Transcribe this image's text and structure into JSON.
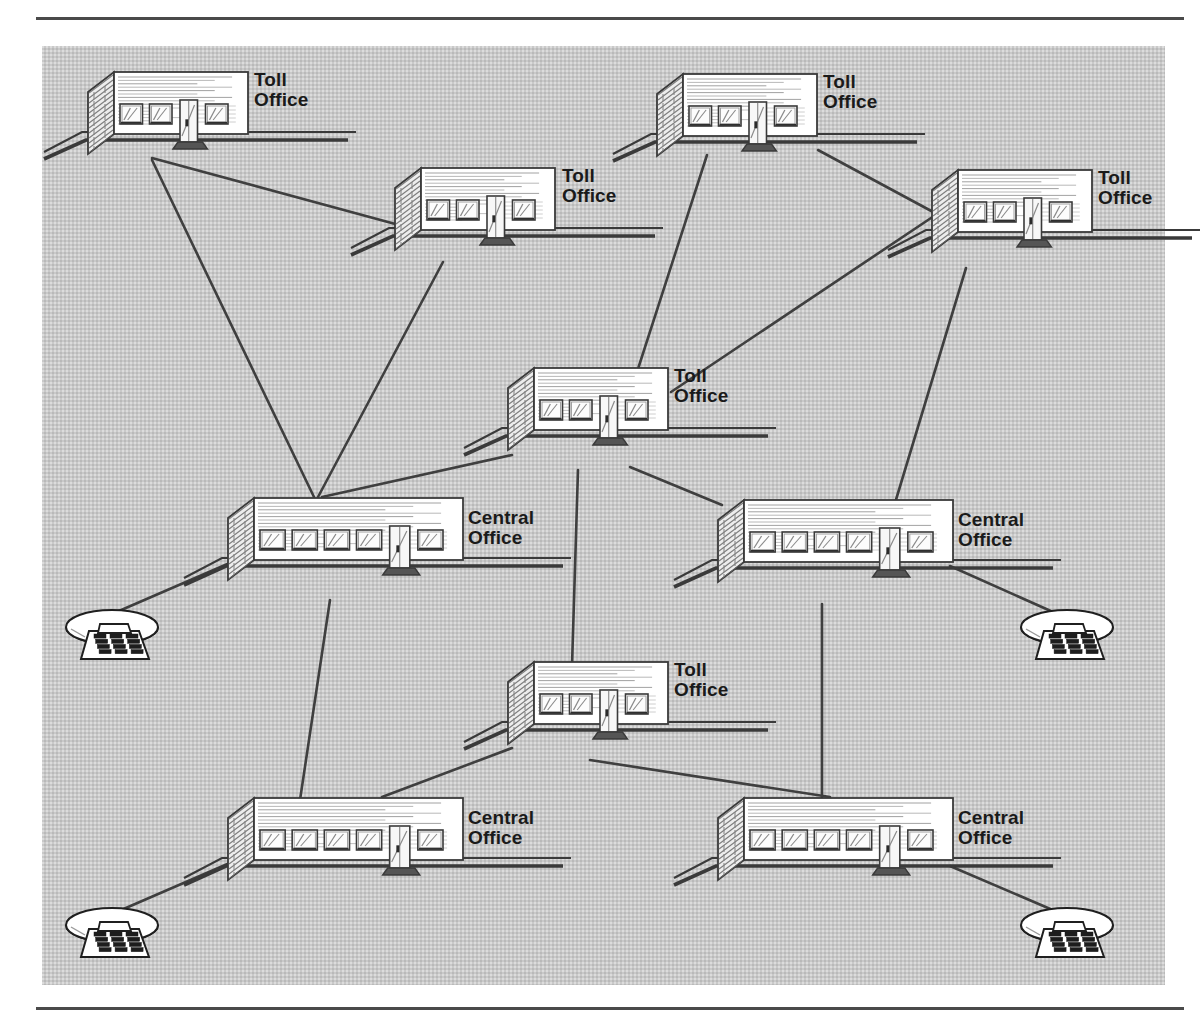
{
  "figure": {
    "type": "telephone-network-hierarchy-diagram",
    "background_color": "#c9c9c9",
    "line_color": "#3a3a3a",
    "building_face_color": "#ffffff",
    "labels": {
      "toll_office": "Toll\nOffice",
      "central_office": "Central\nOffice"
    }
  },
  "nodes": [
    {
      "id": "toll-1",
      "kind": "toll-office",
      "label": "Toll\nOffice",
      "x": 88,
      "y": 72,
      "width": 160,
      "label_x": 254,
      "label_y": 70
    },
    {
      "id": "toll-2",
      "kind": "toll-office",
      "label": "Toll\nOffice",
      "x": 395,
      "y": 168,
      "width": 160,
      "label_x": 562,
      "label_y": 166
    },
    {
      "id": "toll-3",
      "kind": "toll-office",
      "label": "Toll\nOffice",
      "x": 657,
      "y": 74,
      "width": 160,
      "label_x": 823,
      "label_y": 72
    },
    {
      "id": "toll-4",
      "kind": "toll-office",
      "label": "Toll\nOffice",
      "x": 932,
      "y": 170,
      "width": 160,
      "label_x": 1098,
      "label_y": 168
    },
    {
      "id": "toll-5",
      "kind": "toll-office",
      "label": "Toll\nOffice",
      "x": 508,
      "y": 368,
      "width": 160,
      "label_x": 674,
      "label_y": 366
    },
    {
      "id": "toll-6",
      "kind": "toll-office",
      "label": "Toll\nOffice",
      "x": 508,
      "y": 662,
      "width": 160,
      "label_x": 674,
      "label_y": 660
    },
    {
      "id": "co-1",
      "kind": "central-office",
      "label": "Central\nOffice",
      "x": 228,
      "y": 498,
      "width": 235,
      "label_x": 468,
      "label_y": 508
    },
    {
      "id": "co-2",
      "kind": "central-office",
      "label": "Central\nOffice",
      "x": 718,
      "y": 500,
      "width": 235,
      "label_x": 958,
      "label_y": 510
    },
    {
      "id": "co-3",
      "kind": "central-office",
      "label": "Central\nOffice",
      "x": 228,
      "y": 798,
      "width": 235,
      "label_x": 468,
      "label_y": 808
    },
    {
      "id": "co-4",
      "kind": "central-office",
      "label": "Central\nOffice",
      "x": 718,
      "y": 798,
      "width": 235,
      "label_x": 958,
      "label_y": 808
    }
  ],
  "telephones": [
    {
      "id": "phone-1",
      "x": 65,
      "y": 607,
      "connects_to": "co-1"
    },
    {
      "id": "phone-2",
      "x": 1020,
      "y": 607,
      "connects_to": "co-2"
    },
    {
      "id": "phone-3",
      "x": 65,
      "y": 905,
      "connects_to": "co-3"
    },
    {
      "id": "phone-4",
      "x": 1020,
      "y": 905,
      "connects_to": "co-4"
    }
  ],
  "links": [
    {
      "from": "toll-1",
      "to": "toll-2",
      "x1": 152,
      "y1": 158,
      "x2": 399,
      "y2": 225
    },
    {
      "from": "toll-1",
      "to": "co-1",
      "x1": 152,
      "y1": 160,
      "x2": 314,
      "y2": 497
    },
    {
      "from": "toll-2",
      "to": "co-1",
      "x1": 443,
      "y1": 262,
      "x2": 318,
      "y2": 497
    },
    {
      "from": "toll-3",
      "to": "toll-4",
      "x1": 818,
      "y1": 150,
      "x2": 935,
      "y2": 213
    },
    {
      "from": "toll-3",
      "to": "toll-5",
      "x1": 707,
      "y1": 155,
      "x2": 637,
      "y2": 372
    },
    {
      "from": "toll-4",
      "to": "toll-5",
      "x1": 934,
      "y1": 216,
      "x2": 671,
      "y2": 392
    },
    {
      "from": "toll-4",
      "to": "co-2",
      "x1": 966,
      "y1": 268,
      "x2": 895,
      "y2": 503
    },
    {
      "from": "toll-5",
      "to": "co-1",
      "x1": 512,
      "y1": 455,
      "x2": 322,
      "y2": 497
    },
    {
      "from": "toll-5",
      "to": "toll-6",
      "x1": 578,
      "y1": 470,
      "x2": 572,
      "y2": 666
    },
    {
      "from": "toll-5",
      "to": "co-2",
      "x1": 630,
      "y1": 467,
      "x2": 722,
      "y2": 505
    },
    {
      "from": "toll-6",
      "to": "co-3",
      "x1": 512,
      "y1": 748,
      "x2": 382,
      "y2": 797
    },
    {
      "from": "toll-6",
      "to": "co-4",
      "x1": 590,
      "y1": 760,
      "x2": 830,
      "y2": 797
    },
    {
      "from": "co-1",
      "to": "co-3",
      "x1": 330,
      "y1": 600,
      "x2": 300,
      "y2": 800
    },
    {
      "from": "co-2",
      "to": "co-4",
      "x1": 822,
      "y1": 604,
      "x2": 822,
      "y2": 797
    },
    {
      "from": "co-1",
      "to": "phone-1",
      "x1": 232,
      "y1": 562,
      "x2": 112,
      "y2": 614
    },
    {
      "from": "co-2",
      "to": "phone-2",
      "x1": 950,
      "y1": 566,
      "x2": 1062,
      "y2": 616
    },
    {
      "from": "co-3",
      "to": "phone-3",
      "x1": 232,
      "y1": 862,
      "x2": 112,
      "y2": 914
    },
    {
      "from": "co-4",
      "to": "phone-4",
      "x1": 950,
      "y1": 866,
      "x2": 1062,
      "y2": 914
    }
  ]
}
